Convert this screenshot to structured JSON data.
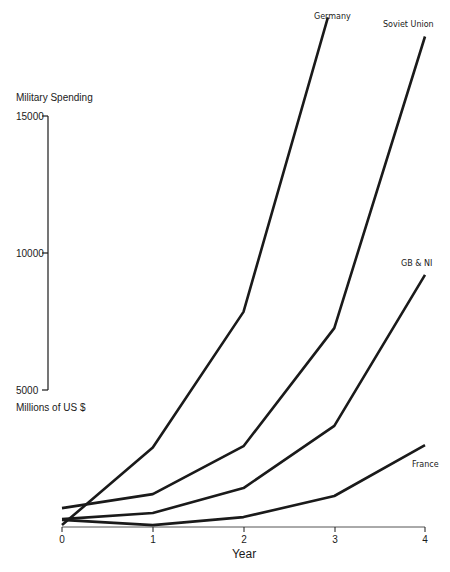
{
  "chart_data": {
    "type": "line",
    "title": "",
    "xlabel": "Year",
    "ylabel": "Military Spending",
    "ylabel_units": "Millions of US $",
    "x": [
      0,
      1,
      2,
      3,
      4
    ],
    "x_tick_labels": [
      "0",
      "1",
      "2",
      "3",
      "4"
    ],
    "y_tick_labels": [
      "5000",
      "10000",
      "15000"
    ],
    "y_ticks": [
      5000,
      10000,
      15000
    ],
    "y_axis_range_drawn": [
      5000,
      15000
    ],
    "xlim": [
      0,
      4
    ],
    "ylim": [
      0,
      19000
    ],
    "grid": false,
    "legend": "inline labels at line ends",
    "series": [
      {
        "name": "Germany",
        "x": [
          0,
          1,
          2,
          2.93
        ],
        "values": [
          70,
          2900,
          7850,
          18600
        ]
      },
      {
        "name": "Soviet Union",
        "x": [
          0,
          1,
          2,
          3,
          4
        ],
        "values": [
          690,
          1200,
          2950,
          7260,
          17900
        ]
      },
      {
        "name": "GB & NI",
        "x": [
          0,
          1,
          2,
          3,
          4
        ],
        "values": [
          290,
          510,
          1420,
          3690,
          9200
        ]
      },
      {
        "name": "France",
        "x": [
          0,
          1,
          2,
          3,
          4
        ],
        "values": [
          260,
          70,
          360,
          1130,
          2990
        ]
      }
    ]
  },
  "labels": {
    "ylabel": "Military Spending",
    "units": "Millions of US $",
    "xlabel": "Year",
    "yticks": [
      "15000",
      "10000",
      "5000"
    ],
    "xticks": [
      "0",
      "1",
      "2",
      "3",
      "4"
    ],
    "series": [
      "Germany",
      "Soviet Union",
      "GB & NI",
      "France"
    ]
  }
}
